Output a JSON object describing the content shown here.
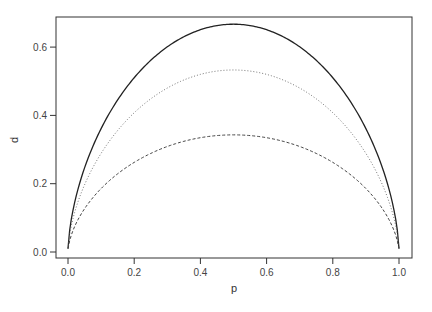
{
  "chart_data": {
    "type": "line",
    "title": "",
    "xlabel": "p",
    "ylabel": "d",
    "xlim": [
      0,
      1
    ],
    "ylim": [
      0,
      0.68
    ],
    "xticks": [
      "0.0",
      "0.2",
      "0.4",
      "0.6",
      "0.8",
      "1.0"
    ],
    "yticks": [
      "0.0",
      "0.2",
      "0.4",
      "0.6"
    ],
    "grid": false,
    "legend": null,
    "x": [
      0.0,
      0.05,
      0.1,
      0.2,
      0.3,
      0.4,
      0.5,
      0.6,
      0.7,
      0.8,
      0.9,
      0.95,
      1.0
    ],
    "series": [
      {
        "name": "solid",
        "style": "solid",
        "peak": 0.667,
        "values": [
          0.01,
          0.25,
          0.36,
          0.5,
          0.6,
          0.65,
          0.667,
          0.65,
          0.6,
          0.5,
          0.36,
          0.25,
          0.01
        ]
      },
      {
        "name": "dotted",
        "style": "dotted",
        "peak": 0.533,
        "values": [
          0.01,
          0.2,
          0.29,
          0.41,
          0.48,
          0.52,
          0.533,
          0.52,
          0.48,
          0.41,
          0.29,
          0.2,
          0.01
        ]
      },
      {
        "name": "dashed",
        "style": "dashed",
        "peak": 0.343,
        "values": [
          0.01,
          0.13,
          0.19,
          0.26,
          0.31,
          0.335,
          0.343,
          0.335,
          0.31,
          0.26,
          0.19,
          0.13,
          0.01
        ]
      }
    ]
  }
}
